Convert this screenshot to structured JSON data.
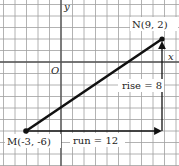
{
  "chart_data": {
    "type": "diagram",
    "title": "",
    "grid": true,
    "axes": {
      "x_label": "x",
      "y_label": "y",
      "origin_label": "O"
    },
    "xlim": [
      -5,
      10
    ],
    "ylim": [
      -8,
      5
    ],
    "points": [
      {
        "name": "M",
        "label": "M(-3, -6)",
        "x": -3,
        "y": -6
      },
      {
        "name": "N",
        "label": "N(9, 2)",
        "x": 9,
        "y": 2
      }
    ],
    "segments": [
      {
        "from": "M",
        "to": "N",
        "style": "thick"
      }
    ],
    "run": {
      "label": "run = 12",
      "value": 12,
      "from": [
        -3,
        -6
      ],
      "to": [
        9,
        -6
      ]
    },
    "rise": {
      "label": "rise = 8",
      "value": 8,
      "from": [
        9,
        -6
      ],
      "to": [
        9,
        2
      ]
    }
  },
  "labels": {
    "x_axis": "x",
    "y_axis": "y",
    "origin": "O",
    "point_m": "M(-3, -6)",
    "point_n": "N(9, 2)",
    "run": "run = 12",
    "rise": "rise = 8"
  },
  "colors": {
    "grid": "#9a9a9a",
    "axis": "#555555",
    "segment": "#111111",
    "background": "#ffffff"
  }
}
